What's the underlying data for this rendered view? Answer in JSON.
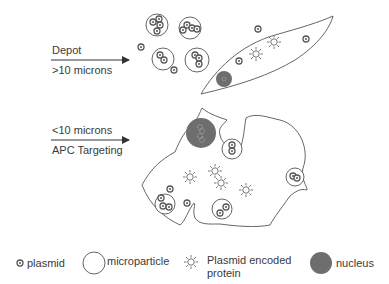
{
  "arrows": {
    "depot": {
      "top_label": "Depot",
      "bottom_label": ">10 microns"
    },
    "apc": {
      "top_label": "<10 microns",
      "bottom_label": "APC Targeting"
    }
  },
  "legend": {
    "plasmid": "plasmid",
    "microparticle": "microparticle",
    "protein_line1": "Plasmid encoded",
    "protein_line2": "protein",
    "nucleus": "nucleus"
  },
  "colors": {
    "stroke": "#555555",
    "nucleus_fill": "#6e6e6e",
    "text": "#3a3a3a"
  }
}
